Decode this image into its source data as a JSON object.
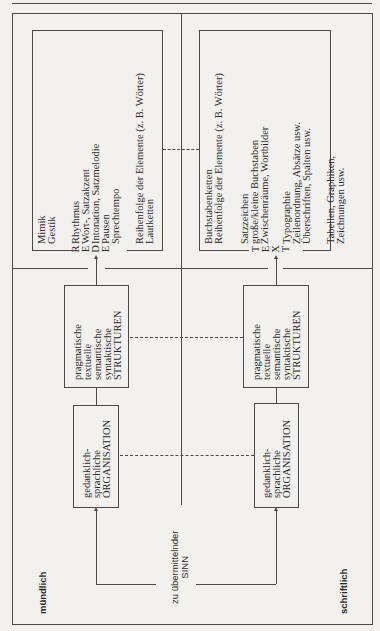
{
  "diagram": {
    "modes": {
      "oral": "mündlich",
      "written": "schriftlich"
    },
    "source": {
      "line1": "zu übermittelnder",
      "line2": "SINN"
    },
    "oral": {
      "organisation": [
        "gedanklich-",
        "sprachliche",
        "ORGANISATION"
      ],
      "strukturen": [
        "pragmatische",
        "textuelle",
        "semantische",
        "syntaktische",
        "STRUKTUREN"
      ],
      "output_letters": [
        "R",
        "E",
        "D",
        "E"
      ],
      "output_word": "REDE",
      "features": {
        "group1": [
          "Mimik",
          "Gestik"
        ],
        "group2": [
          "Rhythmus",
          "Wort-, Satzakzent",
          "Intonation, Satzmelodie",
          "Pausen",
          "Sprechtempo"
        ],
        "group3": [
          "Reihenfolge der Elemente (z. B. Wörter)",
          "Lautketten"
        ]
      }
    },
    "written": {
      "organisation": [
        "gedanklich-",
        "sprachliche",
        "ORGANISATION"
      ],
      "strukturen": [
        "pragmatische",
        "textuelle",
        "semantische",
        "syntaktische",
        "STRUKTUREN"
      ],
      "output_letters": [
        "T",
        "E",
        "X",
        "T"
      ],
      "output_word": "TEXT",
      "features": {
        "group1": [
          "Buchstabenketten",
          "Reihenfolge der Elemente (z. B. Wörter)"
        ],
        "group2": [
          "Satzzeichen",
          "große/kleine Buchstaben",
          "Zwischenräume, Wortbilder"
        ],
        "group3": [
          "Typographie",
          "Zeilenordnung, Absätze usw.",
          "Überschriften, Spalten usw."
        ],
        "group4": [
          "Tabellen, Graphiken,",
          "Zeichnungen usw."
        ]
      }
    }
  }
}
